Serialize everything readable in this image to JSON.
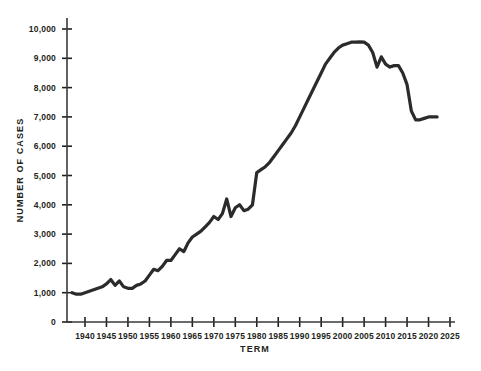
{
  "chart_data": {
    "type": "line",
    "title": "",
    "xlabel": "TERM",
    "ylabel": "NUMBER OF CASES",
    "xlim": [
      1936,
      2025
    ],
    "ylim": [
      0,
      10000
    ],
    "grid": false,
    "legend": false,
    "series_color": "#2b2b2b",
    "x_ticks": [
      1940,
      1945,
      1950,
      1955,
      1960,
      1965,
      1970,
      1975,
      1980,
      1985,
      1990,
      1995,
      2000,
      2005,
      2010,
      2015,
      2020,
      2025
    ],
    "x_tick_labels": [
      "1940",
      "1945",
      "1950",
      "1955",
      "1960",
      "1965",
      "1970",
      "1975",
      "1980",
      "1985",
      "1990",
      "1995",
      "2000",
      "2005",
      "2010",
      "2015",
      "2020",
      "2025"
    ],
    "y_ticks": [
      0,
      1000,
      2000,
      3000,
      4000,
      5000,
      6000,
      7000,
      8000,
      9000,
      10000
    ],
    "y_tick_labels": [
      "0",
      "1,000",
      "2,000",
      "3,000",
      "4,000",
      "5,000",
      "6,000",
      "7,000",
      "8,000",
      "9,000",
      "10,000"
    ],
    "series": [
      {
        "name": "Number of Cases",
        "x": [
          1937,
          1938,
          1939,
          1940,
          1941,
          1942,
          1943,
          1944,
          1945,
          1946,
          1947,
          1948,
          1949,
          1950,
          1951,
          1952,
          1953,
          1954,
          1955,
          1956,
          1957,
          1958,
          1959,
          1960,
          1961,
          1962,
          1963,
          1964,
          1965,
          1966,
          1967,
          1968,
          1969,
          1970,
          1971,
          1972,
          1973,
          1974,
          1975,
          1976,
          1977,
          1978,
          1979,
          1980,
          1981,
          1982,
          1983,
          1984,
          1985,
          1986,
          1987,
          1988,
          1989,
          1990,
          1991,
          1992,
          1993,
          1994,
          1995,
          1996,
          1997,
          1998,
          1999,
          2000,
          2001,
          2002,
          2003,
          2004,
          2005,
          2006,
          2007,
          2008,
          2009,
          2010,
          2011,
          2012,
          2013,
          2014,
          2015,
          2016,
          2017,
          2018,
          2019,
          2020,
          2021,
          2022
        ],
        "values": [
          1000,
          950,
          950,
          1000,
          1050,
          1100,
          1150,
          1200,
          1300,
          1450,
          1250,
          1400,
          1200,
          1150,
          1150,
          1250,
          1300,
          1400,
          1600,
          1800,
          1750,
          1900,
          2100,
          2100,
          2300,
          2500,
          2400,
          2700,
          2900,
          3000,
          3100,
          3250,
          3400,
          3600,
          3500,
          3700,
          4200,
          3600,
          3900,
          4000,
          3800,
          3850,
          4000,
          5100,
          5200,
          5300,
          5450,
          5650,
          5850,
          6050,
          6250,
          6450,
          6700,
          7000,
          7300,
          7600,
          7900,
          8200,
          8500,
          8800,
          9000,
          9200,
          9350,
          9450,
          9500,
          9550,
          9550,
          9560,
          9550,
          9450,
          9200,
          8700,
          9050,
          8800,
          8700,
          8750,
          8750,
          8500,
          8100,
          7200,
          6900,
          6900,
          6950,
          7000,
          7000,
          7000
        ]
      }
    ]
  },
  "axis": {
    "x_title": "TERM",
    "y_title": "NUMBER OF CASES"
  }
}
